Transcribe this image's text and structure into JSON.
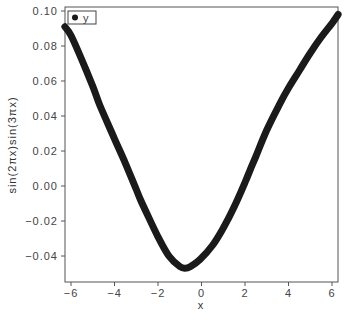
{
  "chart_data": {
    "type": "line",
    "title": "",
    "xlabel": "x",
    "ylabel": "sin(2πx)sin(3πx)",
    "xlim": [
      -6.28,
      6.28
    ],
    "ylim": [
      -0.0555,
      0.1065
    ],
    "grid": false,
    "legend": {
      "position": "upper-left",
      "entries": [
        "y"
      ]
    },
    "x_ticks": [
      -6,
      -4,
      -2,
      0,
      2,
      4,
      6
    ],
    "x_tick_labels": [
      "−6",
      "−4",
      "−2",
      "0",
      "2",
      "4",
      "6"
    ],
    "y_ticks": [
      0.1,
      0.08,
      0.06,
      0.04,
      0.02,
      0.0,
      -0.02,
      -0.04
    ],
    "y_tick_labels": [
      "0.10",
      "0.08",
      "0.06",
      "0.04",
      "0.02",
      "0.00",
      "−0.02",
      "−0.04"
    ],
    "series": [
      {
        "name": "y",
        "color": "#1a1a1a",
        "x": [
          -6.28,
          -6.0,
          -5.5,
          -5.0,
          -4.67,
          -4.0,
          -3.5,
          -3.0,
          -2.8,
          -2.5,
          -2.0,
          -1.5,
          -1.0,
          -0.76,
          -0.5,
          -0.07,
          0.5,
          1.0,
          1.5,
          2.0,
          2.23,
          2.5,
          3.0,
          3.6,
          4.0,
          4.5,
          5.0,
          5.5,
          6.0,
          6.28
        ],
        "y": [
          0.091,
          0.086,
          0.072,
          0.057,
          0.046,
          0.027,
          0.013,
          -0.002,
          -0.008,
          -0.016,
          -0.029,
          -0.04,
          -0.046,
          -0.047,
          -0.046,
          -0.042,
          -0.034,
          -0.024,
          -0.012,
          0.002,
          0.009,
          0.017,
          0.032,
          0.047,
          0.056,
          0.066,
          0.076,
          0.085,
          0.093,
          0.098
        ]
      }
    ]
  }
}
